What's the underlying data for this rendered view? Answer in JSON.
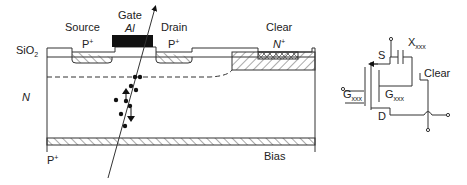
{
  "device": {
    "labels": {
      "source": "Source",
      "source_doping": "P",
      "source_doping_sup": "+",
      "gate": "Gate",
      "gate_material": "Al",
      "drain": "Drain",
      "drain_doping": "P",
      "drain_doping_sup": "+",
      "clear": "Clear",
      "clear_doping": "N",
      "clear_doping_sup": "+",
      "oxide": "SiO",
      "oxide_sub": "2",
      "bulk": "N",
      "back": "P",
      "back_sup": "+",
      "bias": "Bias"
    }
  },
  "circuit": {
    "labels": {
      "source": "S",
      "drain": "D",
      "capacitor": "X",
      "capacitor_sub": "xxx",
      "gate_external": "G",
      "gate_external_sub": "xxx",
      "gate_internal": "G",
      "gate_internal_sub": "xxx",
      "clear": "Clear"
    }
  },
  "colors": {
    "line": "#333333",
    "gate_fill": "#111111",
    "hatch": "#555555"
  }
}
